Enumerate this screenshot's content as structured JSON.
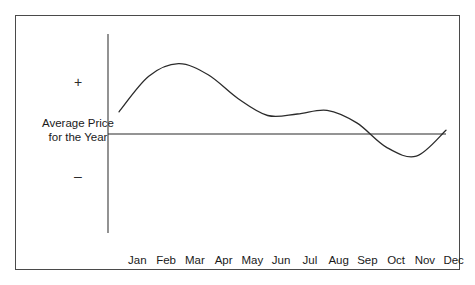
{
  "figure": {
    "border_color": "#4a4a4a",
    "background": "#ffffff"
  },
  "y_axis": {
    "positive_symbol": "+",
    "negative_symbol": "–",
    "title_line1": "Average Price",
    "title_line2": "for the Year",
    "title": "Average Price\nfor the Year"
  },
  "chart_data": {
    "type": "line",
    "title": "",
    "subtitle": "",
    "xlabel": "",
    "ylabel": "Average Price\nfor the Year",
    "categories": [
      "Jan",
      "Feb",
      "Mar",
      "Apr",
      "May",
      "Jun",
      "Jul",
      "Aug",
      "Sep",
      "Oct",
      "Nov",
      "Dec"
    ],
    "series": [
      {
        "name": "Average Price for the Year",
        "values": [
          0.3,
          0.78,
          0.95,
          0.8,
          0.48,
          0.25,
          0.27,
          0.32,
          0.15,
          -0.18,
          -0.3,
          0.05
        ],
        "color": "#2b2b2b",
        "line_width": 1.3,
        "smooth": true
      }
    ],
    "reference_line": {
      "name": "Average Price for the Year",
      "value": 0,
      "color": "#2b2b2b",
      "line_width": 1.2
    },
    "ylim": [
      -1.0,
      1.0
    ],
    "y_tick_labels": [
      "+",
      "–"
    ],
    "grid": false,
    "legend": false,
    "legend_position": "none",
    "axis_color": "#4a4a4a"
  },
  "colors": {
    "curve": "#2b2b2b",
    "axis": "#4a4a4a",
    "text": "#1a1a1a",
    "background": "#ffffff"
  }
}
